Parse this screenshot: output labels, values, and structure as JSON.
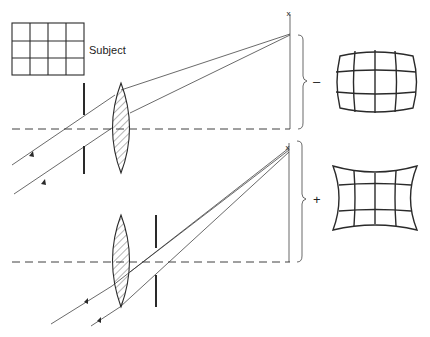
{
  "diagram": {
    "subject_label": "Subject",
    "upper_sign": "–",
    "lower_sign": "+",
    "upper_result": "barrel-distortion-grid",
    "lower_result": "pincushion-distortion-grid",
    "image_marker": "x",
    "colors": {
      "line": "#2a2a2a",
      "background": "#ffffff"
    }
  }
}
